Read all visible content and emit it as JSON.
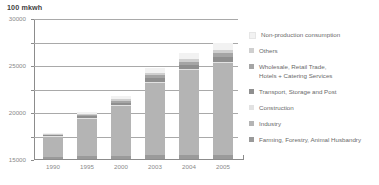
{
  "chart_data": {
    "type": "bar",
    "subtype": "stacked-column",
    "title": "100 mkwh",
    "xlabel": "",
    "ylabel": "100 mkwh",
    "ylim": [
      0,
      30000
    ],
    "ytick_labels": [
      "0",
      "5000",
      "10000",
      "15000",
      "20000",
      "25000",
      "30000"
    ],
    "ytick_values": [
      0,
      5000,
      10000,
      15000,
      20000,
      25000,
      30000
    ],
    "grid": true,
    "legend_position": "right",
    "categories": [
      "1990",
      "1995",
      "2000",
      "2003",
      "2004",
      "2005"
    ],
    "series": [
      {
        "name": "Farming, Forestry, Animal Husbandry",
        "color": "#9a9a9a",
        "values": [
          500,
          650,
          700,
          750,
          800,
          850
        ]
      },
      {
        "name": "Industry",
        "color": "#b4b4b4",
        "values": [
          4200,
          7900,
          10500,
          15500,
          18100,
          19600
        ]
      },
      {
        "name": "Construction",
        "color": "#e2e2e2",
        "values": [
          120,
          150,
          200,
          230,
          250,
          270
        ]
      },
      {
        "name": "Transport, Storage and Post",
        "color": "#8f8f8f",
        "values": [
          200,
          350,
          500,
          700,
          800,
          950
        ]
      },
      {
        "name": "Wholesale, Retail Trade,\nHotels + Catering Services",
        "color": "#a5a5a5",
        "values": [
          180,
          300,
          450,
          600,
          700,
          800
        ]
      },
      {
        "name": "Others",
        "color": "#cfcfcf",
        "values": [
          150,
          250,
          350,
          450,
          550,
          650
        ]
      },
      {
        "name": "Non-production consumption",
        "color": "#f2f2f2",
        "values": [
          250,
          400,
          800,
          1100,
          1300,
          1500
        ]
      }
    ],
    "totals": [
      5600,
      10000,
      13500,
      19330,
      22500,
      24620
    ]
  },
  "legend": {
    "items": [
      {
        "label": "Non-production consumption",
        "color": "#f2f2f2"
      },
      {
        "label": "Others",
        "color": "#cfcfcf"
      },
      {
        "label": "Wholesale, Retail Trade,\nHotels + Catering Services",
        "color": "#a5a5a5"
      },
      {
        "label": "Transport, Storage and Post",
        "color": "#8f8f8f"
      },
      {
        "label": "Construction",
        "color": "#e2e2e2"
      },
      {
        "label": "Industry",
        "color": "#b4b4b4"
      },
      {
        "label": "Farming, Forestry, Animal Husbandry",
        "color": "#9a9a9a"
      }
    ]
  },
  "colors": {
    "axis": "#8c8c8c",
    "grid": "#a9a9a9",
    "text": "#8a8a8a",
    "title": "#3f3f3f",
    "background": "#ffffff"
  }
}
